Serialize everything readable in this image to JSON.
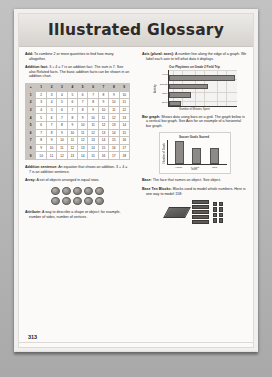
{
  "header": {
    "title": "Illustrated Glossary"
  },
  "page_number": "313",
  "left_column": {
    "entries": [
      {
        "term": "Add:",
        "body": " To combine 2 or more quantities to find how many altogether."
      },
      {
        "term": "Addition fact:",
        "body": " 3 + 4 = 7 is an addition fact. The sum is 7. See also Related facts. The basic addition facts can be shown in an addition chart."
      },
      {
        "term": "Addition sentence:",
        "body": " An equation that shows an addition. 3 + 4 = 7 is an addition sentence."
      },
      {
        "term": "Array:",
        "body": " A set of objects arranged in equal rows."
      },
      {
        "term": "Attribute:",
        "body": " A way to describe a shape or object; for example, number of sides, number of vertices."
      }
    ]
  },
  "right_column": {
    "entries": [
      {
        "term": "Axis (plural: axes):",
        "body": " A number line along the edge of a graph. We label each axis to tell what data it displays."
      },
      {
        "term": "Bar graph:",
        "body": " Shows data using bars on a grid. The graph below is a vertical bar graph. See Axis for an example of a horizontal bar graph."
      },
      {
        "term": "Base:",
        "body": " The face that names an object. See object."
      },
      {
        "term": "Base Ten Blocks:",
        "body": " Blocks used to model whole numbers. Here is one way to model 158:"
      }
    ]
  },
  "addition_chart": {
    "corner": "+",
    "col_headers": [
      "1",
      "2",
      "3",
      "4",
      "5",
      "6",
      "7",
      "8",
      "9"
    ],
    "row_headers": [
      "1",
      "2",
      "3",
      "4",
      "5",
      "6",
      "7",
      "8",
      "9"
    ],
    "rows": [
      [
        "2",
        "3",
        "4",
        "5",
        "6",
        "7",
        "8",
        "9",
        "10"
      ],
      [
        "3",
        "4",
        "5",
        "6",
        "7",
        "8",
        "9",
        "10",
        "11"
      ],
      [
        "4",
        "5",
        "6",
        "7",
        "8",
        "9",
        "10",
        "11",
        "12"
      ],
      [
        "5",
        "6",
        "7",
        "8",
        "9",
        "10",
        "11",
        "12",
        "13"
      ],
      [
        "6",
        "7",
        "8",
        "9",
        "10",
        "11",
        "12",
        "13",
        "14"
      ],
      [
        "7",
        "8",
        "9",
        "10",
        "11",
        "12",
        "13",
        "14",
        "15"
      ],
      [
        "8",
        "9",
        "10",
        "11",
        "12",
        "13",
        "14",
        "15",
        "16"
      ],
      [
        "9",
        "10",
        "11",
        "12",
        "13",
        "14",
        "15",
        "16",
        "17"
      ],
      [
        "10",
        "11",
        "12",
        "13",
        "14",
        "15",
        "16",
        "17",
        "18"
      ]
    ]
  },
  "array_figure": {
    "rows": 2,
    "columns": 5
  },
  "base_ten_blocks": {
    "flats": 1,
    "rods": 5,
    "units": 8,
    "models_number": "158"
  },
  "chart_data": [
    {
      "type": "bar",
      "orientation": "horizontal",
      "title": "Our Playtimes on Grade 2 Field Trip",
      "categories": [
        "Field",
        "Swings",
        "Slide",
        "Court"
      ],
      "values": [
        38,
        22,
        12,
        6
      ],
      "xlabel": "Number of Minutes Spent",
      "ylabel": "Activity",
      "xlim": [
        0,
        40
      ],
      "grid": true
    },
    {
      "type": "bar",
      "orientation": "vertical",
      "title": "Soccer Goals Scored",
      "categories": [
        "Hawks",
        "Lions",
        "Owls"
      ],
      "values": [
        9,
        6,
        6
      ],
      "xlabel": "Team",
      "ylabel": "Number of Goals",
      "ylim": [
        0,
        10
      ],
      "grid": false
    }
  ]
}
